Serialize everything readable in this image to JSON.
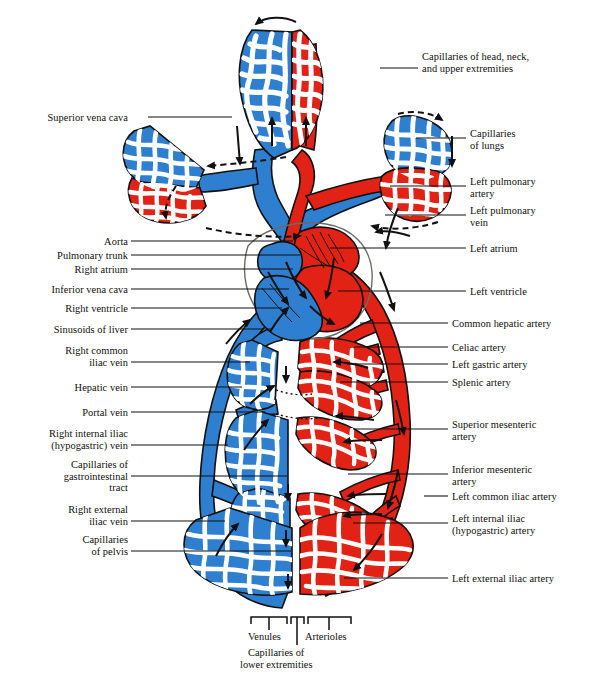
{
  "figure": {
    "colors": {
      "venous_blue": "#2f7fd1",
      "arterial_red": "#e22214",
      "outline": "#111111",
      "background": "#ffffff",
      "label_text": "#100f0d",
      "leader_line": "#111111"
    }
  },
  "labels_left": [
    {
      "name": "superior-vena-cava",
      "text": "Superior vena cava",
      "lines": [
        "Superior vena cava"
      ],
      "x": 29,
      "y": 112,
      "leader_x1": 148,
      "leader_y1": 117,
      "leader_x2": 232,
      "leader_y2": 117
    },
    {
      "name": "aorta",
      "text": "Aorta",
      "lines": [
        "Aorta"
      ],
      "x": 96,
      "y": 236,
      "leader_x1": 131,
      "leader_y1": 241,
      "leader_x2": 293,
      "leader_y2": 241
    },
    {
      "name": "pulmonary-trunk",
      "text": "Pulmonary trunk",
      "lines": [
        "Pulmonary trunk"
      ],
      "x": 38,
      "y": 250,
      "leader_x1": 131,
      "leader_y1": 255,
      "leader_x2": 300,
      "leader_y2": 255
    },
    {
      "name": "right-atrium",
      "text": "Right atrium",
      "lines": [
        "Right atrium"
      ],
      "x": 59,
      "y": 264,
      "leader_x1": 131,
      "leader_y1": 269,
      "leader_x2": 293,
      "leader_y2": 269
    },
    {
      "name": "inferior-vena-cava",
      "text": "Inferior vena cava",
      "lines": [
        "Inferior vena cava"
      ],
      "x": 32,
      "y": 284,
      "leader_x1": 131,
      "leader_y1": 289,
      "leader_x2": 289,
      "leader_y2": 289
    },
    {
      "name": "right-ventricle",
      "text": "Right ventricle",
      "lines": [
        "Right ventricle"
      ],
      "x": 50,
      "y": 303,
      "leader_x1": 131,
      "leader_y1": 308,
      "leader_x2": 282,
      "leader_y2": 308
    },
    {
      "name": "sinusoids-of-liver",
      "text": "Sinusoids of liver",
      "lines": [
        "Sinusoids of liver"
      ],
      "x": 33,
      "y": 324,
      "leader_x1": 131,
      "leader_y1": 329,
      "leader_x2": 272,
      "leader_y2": 329
    },
    {
      "name": "right-common-iliac-vein",
      "text": "Right common iliac vein",
      "lines": [
        "Right common",
        "iliac vein"
      ],
      "x": 46,
      "y": 345,
      "leader_x1": 131,
      "leader_y1": 362,
      "leader_x2": 250,
      "leader_y2": 362
    },
    {
      "name": "hepatic-vein",
      "text": "Hepatic vein",
      "lines": [
        "Hepatic vein"
      ],
      "x": 59,
      "y": 382,
      "leader_x1": 131,
      "leader_y1": 387,
      "leader_x2": 242,
      "leader_y2": 387
    },
    {
      "name": "portal-vein",
      "text": "Portal vein",
      "lines": [
        "Portal vein"
      ],
      "x": 68,
      "y": 407,
      "leader_x1": 131,
      "leader_y1": 412,
      "leader_x2": 265,
      "leader_y2": 412
    },
    {
      "name": "right-internal-iliac-hypogastric-vein",
      "text": "Right internal iliac (hypogastric) vein",
      "lines": [
        "Right internal iliac",
        "(hypogastric) vein"
      ],
      "x": 18,
      "y": 428,
      "leader_x1": 131,
      "leader_y1": 445,
      "leader_x2": 228,
      "leader_y2": 445
    },
    {
      "name": "capillaries-of-gastrointestinal-tract",
      "text": "Capillaries of gastrointestinal tract",
      "lines": [
        "Capillaries of",
        "gastrointestinal",
        "tract"
      ],
      "x": 46,
      "y": 459,
      "leader_x1": 131,
      "leader_y1": 476,
      "leader_x2": 287,
      "leader_y2": 476
    },
    {
      "name": "right-external-iliac-vein",
      "text": "Right external iliac vein",
      "lines": [
        "Right external",
        "iliac vein"
      ],
      "x": 53,
      "y": 504,
      "leader_x1": 131,
      "leader_y1": 521,
      "leader_x2": 225,
      "leader_y2": 521
    },
    {
      "name": "capillaries-of-pelvis",
      "text": "Capillaries of pelvis",
      "lines": [
        "Capillaries",
        "of pelvis"
      ],
      "x": 69,
      "y": 534,
      "leader_x1": 131,
      "leader_y1": 551,
      "leader_x2": 291,
      "leader_y2": 551
    }
  ],
  "labels_right": [
    {
      "name": "capillaries-of-head-neck-and-upper-extremities",
      "text": "Capillaries of head, neck, and upper extremities",
      "lines": [
        "Capillaries of head, neck,",
        "and upper extremities"
      ],
      "x": 422,
      "y": 51,
      "leader_x1": 380,
      "leader_y1": 68,
      "leader_x2": 418,
      "leader_y2": 68
    },
    {
      "name": "capillaries-of-lungs",
      "text": "Capillaries of lungs",
      "lines": [
        "Capillaries",
        "of lungs"
      ],
      "x": 470,
      "y": 128,
      "leader_x1": 416,
      "leader_y1": 138,
      "leader_x2": 466,
      "leader_y2": 138
    },
    {
      "name": "left-pulmonary-artery",
      "text": "Left pulmonary artery",
      "lines": [
        "Left pulmonary",
        "artery"
      ],
      "x": 470,
      "y": 176,
      "leader_x1": 390,
      "leader_y1": 186,
      "leader_x2": 466,
      "leader_y2": 186
    },
    {
      "name": "left-pulmonary-vein",
      "text": "Left pulmonary vein",
      "lines": [
        "Left pulmonary",
        "vein"
      ],
      "x": 470,
      "y": 205,
      "leader_x1": 385,
      "leader_y1": 215,
      "leader_x2": 466,
      "leader_y2": 215
    },
    {
      "name": "left-atrium",
      "text": "Left atrium",
      "lines": [
        "Left atrium"
      ],
      "x": 470,
      "y": 243,
      "leader_x1": 330,
      "leader_y1": 248,
      "leader_x2": 466,
      "leader_y2": 248
    },
    {
      "name": "left-ventricle",
      "text": "Left ventricle",
      "lines": [
        "Left ventricle"
      ],
      "x": 470,
      "y": 286,
      "leader_x1": 338,
      "leader_y1": 291,
      "leader_x2": 466,
      "leader_y2": 291
    },
    {
      "name": "common-hepatic-artery",
      "text": "Common hepatic artery",
      "lines": [
        "Common hepatic artery"
      ],
      "x": 452,
      "y": 318,
      "leader_x1": 360,
      "leader_y1": 323,
      "leader_x2": 448,
      "leader_y2": 323
    },
    {
      "name": "celiac-artery",
      "text": "Celiac artery",
      "lines": [
        "Celiac artery"
      ],
      "x": 452,
      "y": 342,
      "leader_x1": 354,
      "leader_y1": 347,
      "leader_x2": 448,
      "leader_y2": 347
    },
    {
      "name": "left-gastric-artery",
      "text": "Left gastric artery",
      "lines": [
        "Left gastric artery"
      ],
      "x": 452,
      "y": 359,
      "leader_x1": 347,
      "leader_y1": 364,
      "leader_x2": 448,
      "leader_y2": 364
    },
    {
      "name": "splenic-artery",
      "text": "Splenic artery",
      "lines": [
        "Splenic artery"
      ],
      "x": 452,
      "y": 377,
      "leader_x1": 340,
      "leader_y1": 382,
      "leader_x2": 448,
      "leader_y2": 382
    },
    {
      "name": "superior-mesenteric-artery",
      "text": "Superior mesenteric artery",
      "lines": [
        "Superior mesenteric",
        "artery"
      ],
      "x": 452,
      "y": 419,
      "leader_x1": 353,
      "leader_y1": 429,
      "leader_x2": 448,
      "leader_y2": 429
    },
    {
      "name": "inferior-mesenteric-artery",
      "text": "Inferior mesenteric artery",
      "lines": [
        "Inferior mesenteric",
        "artery"
      ],
      "x": 452,
      "y": 464,
      "leader_x1": 348,
      "leader_y1": 474,
      "leader_x2": 448,
      "leader_y2": 474
    },
    {
      "name": "left-common-iliac-artery",
      "text": "Left common iliac artery",
      "lines": [
        "Left common iliac artery"
      ],
      "x": 452,
      "y": 491,
      "leader_x1": 424,
      "leader_y1": 496,
      "leader_x2": 448,
      "leader_y2": 496
    },
    {
      "name": "left-internal-iliac-hypogastric-artery",
      "text": "Left internal iliac (hypogastric) artery",
      "lines": [
        "Left internal iliac",
        "(hypogastric) artery"
      ],
      "x": 452,
      "y": 513,
      "leader_x1": 353,
      "leader_y1": 523,
      "leader_x2": 448,
      "leader_y2": 523
    },
    {
      "name": "left-external-iliac-artery",
      "text": "Left external iliac artery",
      "lines": [
        "Left external iliac artery"
      ],
      "x": 452,
      "y": 573,
      "leader_x1": 344,
      "leader_y1": 578,
      "leader_x2": 448,
      "leader_y2": 578
    }
  ],
  "bottom_brackets": {
    "venules": {
      "name": "venules",
      "text": "Venules",
      "bracket_x1": 251,
      "bracket_x2": 287,
      "bracket_y": 617,
      "stem_x": 269,
      "stem_y2": 630,
      "label_x": 248,
      "label_y": 631
    },
    "capillaries_of_lower_extremities": {
      "name": "capillaries-of-lower-extremities",
      "text": "Capillaries of lower extremities",
      "lines": [
        "Capillaries of",
        "lower extremities"
      ],
      "bracket_x1": 291,
      "bracket_x2": 304,
      "bracket_y": 617,
      "stem_x": 297,
      "stem_y2": 645,
      "label_x": 240,
      "label_y": 647
    },
    "arterioles": {
      "name": "arterioles",
      "text": "Arterioles",
      "bracket_x1": 308,
      "bracket_x2": 351,
      "bracket_y": 617,
      "stem_x": 329,
      "stem_y2": 630,
      "label_x": 305,
      "label_y": 631
    }
  }
}
